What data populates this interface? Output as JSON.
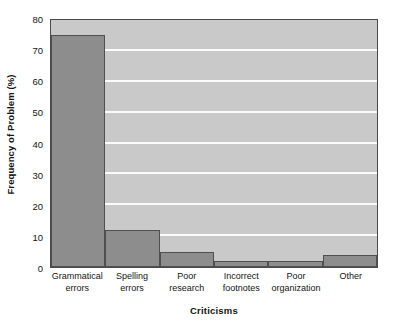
{
  "chart_data": {
    "type": "bar",
    "title": "",
    "xlabel": "Criticisms",
    "ylabel": "Frequency of Problem (%)",
    "categories": [
      "Grammatical errors",
      "Spelling errors",
      "Poor research",
      "Incorrect footnotes",
      "Poor organization",
      "Other"
    ],
    "category_lines": [
      [
        "Grammatical",
        "errors"
      ],
      [
        "Spelling",
        "errors"
      ],
      [
        "Poor",
        "research"
      ],
      [
        "Incorrect",
        "footnotes"
      ],
      [
        "Poor",
        "organization"
      ],
      [
        "Other",
        ""
      ]
    ],
    "values": [
      75,
      12,
      5,
      2,
      2,
      4
    ],
    "ylim": [
      0,
      80
    ],
    "yticks": [
      0,
      10,
      20,
      30,
      40,
      50,
      60,
      70,
      80
    ],
    "ytick_labels": [
      "0",
      "10",
      "20",
      "30",
      "40",
      "50",
      "60",
      "70",
      "80"
    ],
    "grid": true,
    "grid_axis": "y",
    "legend": false,
    "bar_gap": 0,
    "colors": {
      "bar_fill": "#8d8d8d",
      "bar_edge": "#4f4f4f",
      "plot_background": "#c9c9c9",
      "gridline": "#fbfbfb",
      "axis_border": "#4a4a4a",
      "page_background": "#ffffff",
      "text": "#141414"
    }
  }
}
